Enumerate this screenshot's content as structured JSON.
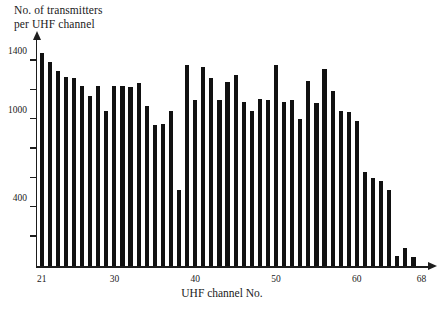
{
  "chart_data": {
    "type": "bar",
    "title": "",
    "ylabel": "No. of transmitters\nper UHF channel",
    "xlabel": "UHF channel No.",
    "ylim": [
      0,
      1500
    ],
    "xlim": [
      20.3,
      68.8
    ],
    "grid": false,
    "legend": null,
    "y_ticks": [
      200,
      400,
      600,
      800,
      1000,
      1200,
      1400
    ],
    "y_tick_labels": [
      "",
      "400",
      "",
      "",
      "1000",
      "",
      "1400"
    ],
    "x_ticks": [
      21,
      30,
      40,
      50,
      60,
      68
    ],
    "x_tick_labels": [
      "21",
      "30",
      "40",
      "50",
      "60",
      "68"
    ],
    "bar_color": "#111111",
    "categories": [
      21,
      22,
      23,
      24,
      25,
      26,
      27,
      28,
      29,
      30,
      31,
      32,
      33,
      34,
      35,
      36,
      37,
      38,
      39,
      40,
      41,
      42,
      43,
      44,
      45,
      46,
      47,
      48,
      49,
      50,
      51,
      52,
      53,
      54,
      55,
      56,
      57,
      58,
      59,
      60,
      61,
      62,
      63,
      64,
      65,
      66,
      67,
      68
    ],
    "values": [
      1455,
      1390,
      1330,
      1290,
      1285,
      1225,
      1160,
      1230,
      1060,
      1225,
      1230,
      1220,
      1250,
      1090,
      960,
      970,
      1060,
      520,
      1370,
      1130,
      1360,
      1285,
      1135,
      1255,
      1300,
      1120,
      1060,
      1140,
      1130,
      1370,
      1120,
      1130,
      1000,
      1260,
      1110,
      1345,
      1190,
      1060,
      1050,
      990,
      640,
      600,
      580,
      520,
      70,
      120,
      60,
      0
    ]
  }
}
